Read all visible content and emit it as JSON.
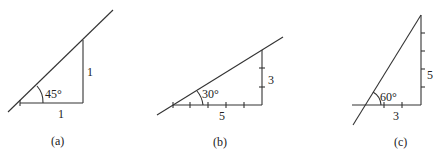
{
  "panels": [
    {
      "id": "a",
      "caption": "(a)",
      "angle_label": "45°",
      "rise_label": "1",
      "run_label": "1",
      "rise_units": 1,
      "run_units": 1
    },
    {
      "id": "b",
      "caption": "(b)",
      "angle_label": "30°",
      "rise_label": "3",
      "run_label": "5",
      "rise_units": 3,
      "run_units": 5
    },
    {
      "id": "c",
      "caption": "(c)",
      "angle_label": "60°",
      "rise_label": "5",
      "run_label": "3",
      "rise_units": 5,
      "run_units": 3
    }
  ]
}
